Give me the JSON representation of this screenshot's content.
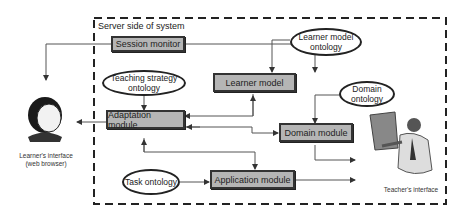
{
  "frame": {
    "title": "Server side of system"
  },
  "boxes": {
    "session_monitor": "Session monitor",
    "learner_model": "Learner model",
    "adaptation_module": "Adaptation module",
    "domain_module": "Domain module",
    "application_module": "Application module"
  },
  "ontologies": {
    "learner_model": "Learner model ontology",
    "teaching_strategy": "Teaching strategy ontology",
    "domain": "Domain ontology",
    "task": "Task ontology"
  },
  "actors": {
    "learner": {
      "label_line1": "Learner's interface",
      "label_line2": "(web browser)",
      "icon": "learner-face-icon"
    },
    "teacher": {
      "label": "Teacher's interface",
      "icon": "teacher-presenting-icon"
    }
  },
  "colors": {
    "box_fill": "#b5b5b5",
    "stroke": "#333333"
  }
}
